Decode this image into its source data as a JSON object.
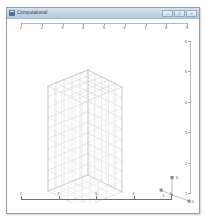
{
  "window": {
    "title": "Computational",
    "icon": "app-icon",
    "controls": [
      {
        "name": "minimize",
        "glyph": "–"
      },
      {
        "name": "maximize",
        "glyph": "□"
      },
      {
        "name": "close",
        "glyph": "×"
      }
    ]
  },
  "viewport": {
    "background_color": "#ffffff",
    "mesh_line_color": "#d9d9d9",
    "axis_color": "#6f6f6f",
    "ruler_color": "#b9b9b9"
  },
  "top_ruler": {
    "name": "horizontal-ruler",
    "labels": [
      "1",
      "2",
      "3",
      "4",
      "5",
      "6",
      "7",
      "8",
      "9"
    ]
  },
  "right_ruler": {
    "name": "vertical-ruler",
    "labels": [
      "6",
      "5",
      "4",
      "3",
      "2",
      "1"
    ]
  },
  "bottom_axis": {
    "name": "bottom-axis",
    "labels": [
      "1",
      "2",
      "3",
      "4",
      "5"
    ]
  },
  "triad": {
    "name": "coordinate-triad",
    "axes": [
      {
        "label": "3",
        "direction": "up"
      },
      {
        "label": "1",
        "direction": "left-down"
      },
      {
        "label": "2",
        "direction": "right-down"
      }
    ]
  },
  "chart_data": {
    "type": "mesh3d",
    "title": "Computational",
    "block_divisions": {
      "x": 5,
      "y": 5,
      "z": 10
    },
    "axes": {
      "x_ticks": [
        "1",
        "2",
        "3",
        "4",
        "5",
        "6",
        "7",
        "8",
        "9"
      ],
      "y_ticks": [
        "1",
        "2",
        "3",
        "4",
        "5",
        "6"
      ],
      "z_ticks": [
        "1",
        "2",
        "3",
        "4",
        "5"
      ]
    }
  }
}
